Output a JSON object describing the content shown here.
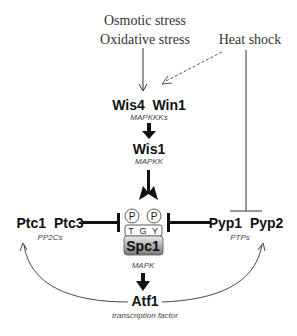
{
  "stimuli": {
    "osmotic": "Osmotic stress",
    "oxidative": "Oxidative stress",
    "heat": "Heat shock"
  },
  "nodes": {
    "mapkkk": {
      "names": "Wis4  Win1",
      "label": "MAPKKKs"
    },
    "mapkk": {
      "name": "Wis1",
      "label": "MAPKK"
    },
    "mapk": {
      "name": "Spc1",
      "label": "MAPK",
      "motif": [
        "T",
        "G",
        "Y"
      ],
      "phospho": [
        "P",
        "P"
      ]
    },
    "pp2c": {
      "names": "Ptc1  Ptc3",
      "label": "PP2Cs"
    },
    "ptp": {
      "names": "Pyp1  Pyp2",
      "label": "PTPs"
    },
    "tf": {
      "name": "Atf1",
      "label": "transcription factor"
    }
  },
  "colors": {
    "box_top": "#e6e6e6",
    "box_bottom": "#7a7a7a",
    "line": "#222222"
  }
}
